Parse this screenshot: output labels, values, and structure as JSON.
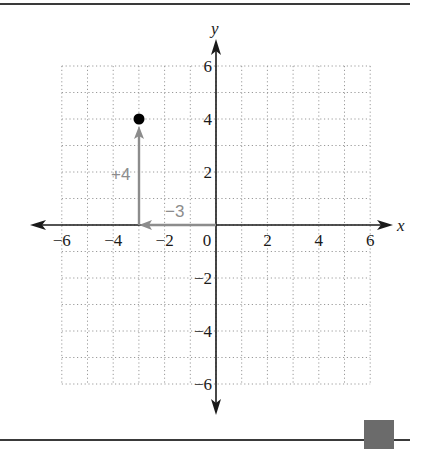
{
  "figure": {
    "axes": {
      "x_label": "x",
      "y_label": "y",
      "x_ticks": [
        "−6",
        "−4",
        "−2",
        "0",
        "2",
        "4",
        "6"
      ],
      "y_ticks": [
        "6",
        "4",
        "2",
        "−2",
        "−4",
        "−6"
      ]
    },
    "annotations": {
      "vertical_move": "+4",
      "horizontal_move": "−3"
    },
    "colors": {
      "axis": "#1a1a1a",
      "grid": "#9a9a9a",
      "arrow": "#8c8c8c",
      "point": "#000000",
      "rule": "#3a3a3a",
      "corner_box": "#6b6b6b"
    }
  },
  "chart_data": {
    "type": "scatter",
    "title": "",
    "xlabel": "x",
    "ylabel": "y",
    "xlim": [
      -6,
      6
    ],
    "ylim": [
      -6,
      6
    ],
    "grid": true,
    "points": [
      {
        "x": -3,
        "y": 4
      }
    ],
    "vectors": [
      {
        "from": [
          0,
          0
        ],
        "to": [
          -3,
          0
        ],
        "label": "−3"
      },
      {
        "from": [
          -3,
          0
        ],
        "to": [
          -3,
          4
        ],
        "label": "+4"
      }
    ]
  }
}
